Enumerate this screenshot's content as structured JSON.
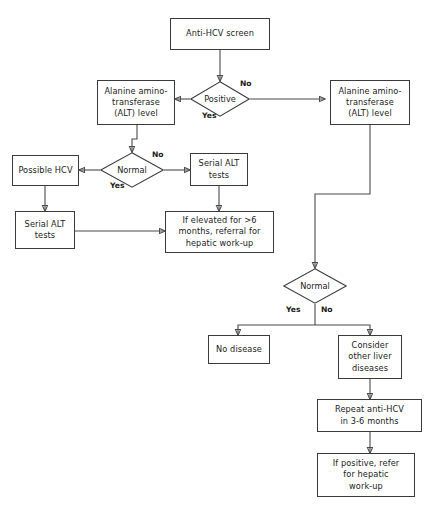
{
  "diagram": {
    "type": "flowchart",
    "background_color": "#ffffff",
    "line_color": "#4a4a4a",
    "box_border_color": "#3a3a3a",
    "text_color": "#1a1a1a"
  },
  "nodes": {
    "anti_hcv_screen": "Anti-HCV screen",
    "positive_decision": "Positive",
    "alt_level_left": "Alanine amino-\ntransferase\n(ALT) level",
    "alt_level_right": "Alanine amino-\ntransferase\n(ALT) level",
    "normal_decision_left": "Normal",
    "possible_hcv": "Possible HCV",
    "serial_alt_tests_right": "Serial ALT\ntests",
    "serial_alt_tests_left": "Serial ALT\ntests",
    "if_elevated": "If elevated for >6\nmonths, referral for\nhepatic work-up",
    "normal_decision_right": "Normal",
    "no_disease": "No disease",
    "consider_other_liver": "Consider\nother liver\ndiseases",
    "repeat_anti_hcv": "Repeat anti-HCV\nin 3-6 months",
    "if_positive_refer": "If positive, refer\nfor hepatic\nwork-up"
  },
  "edge_labels": {
    "positive_yes": "Yes",
    "positive_no": "No",
    "normal_left_yes": "Yes",
    "normal_left_no": "No",
    "normal_right_yes": "Yes",
    "normal_right_no": "No"
  }
}
